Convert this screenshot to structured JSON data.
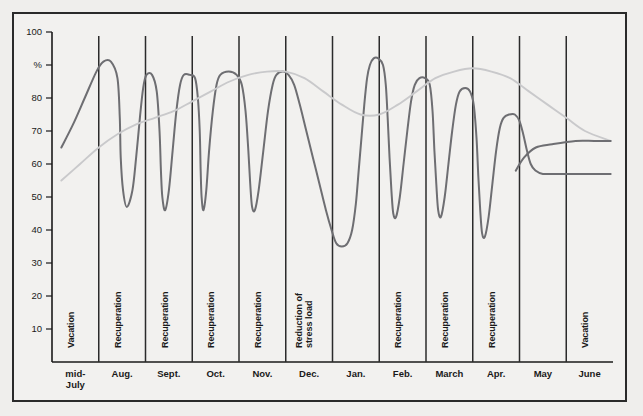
{
  "chart_data": {
    "type": "line",
    "title": "",
    "xlabel": "",
    "ylabel": "%",
    "ylim": [
      0,
      100
    ],
    "grid": false,
    "legend": "none",
    "y_ticks": [
      "100",
      "%",
      "80",
      "70",
      "60",
      "50",
      "40",
      "30",
      "20",
      "10"
    ],
    "y_tick_values": [
      100,
      90,
      80,
      70,
      60,
      50,
      40,
      30,
      20,
      10
    ],
    "categories": [
      "mid-July",
      "Aug.",
      "Sept.",
      "Oct.",
      "Nov.",
      "Dec.",
      "Jan.",
      "Feb.",
      "March",
      "Apr.",
      "May",
      "June"
    ],
    "period_labels": [
      {
        "label": "Vacation",
        "month": "mid-July"
      },
      {
        "label": "Recuperation",
        "month": "Aug."
      },
      {
        "label": "Recuperation",
        "month": "Sept."
      },
      {
        "label": "Recuperation",
        "month": "Oct."
      },
      {
        "label": "Recuperation",
        "month": "Nov."
      },
      {
        "label": "Reduction of stress load",
        "month": "Dec."
      },
      {
        "label": "Recuperation",
        "month": "Feb."
      },
      {
        "label": "Recuperation",
        "month": "March"
      },
      {
        "label": "Recuperation",
        "month": "Apr."
      },
      {
        "label": "Vacation",
        "month": "June"
      }
    ],
    "series": [
      {
        "name": "performance-oscillating",
        "color": "#6e6e72",
        "points": [
          [
            0.2,
            65
          ],
          [
            0.45,
            72
          ],
          [
            0.7,
            80
          ],
          [
            0.95,
            88
          ],
          [
            1.1,
            91
          ],
          [
            1.26,
            91
          ],
          [
            1.4,
            86
          ],
          [
            1.45,
            74
          ],
          [
            1.47,
            62
          ],
          [
            1.52,
            52
          ],
          [
            1.6,
            47
          ],
          [
            1.72,
            52
          ],
          [
            1.8,
            62
          ],
          [
            1.88,
            74
          ],
          [
            1.95,
            83
          ],
          [
            2.02,
            87
          ],
          [
            2.14,
            87
          ],
          [
            2.24,
            82
          ],
          [
            2.3,
            70
          ],
          [
            2.33,
            58
          ],
          [
            2.36,
            50
          ],
          [
            2.42,
            46
          ],
          [
            2.5,
            52
          ],
          [
            2.58,
            64
          ],
          [
            2.66,
            76
          ],
          [
            2.74,
            84
          ],
          [
            2.82,
            87
          ],
          [
            2.95,
            87
          ],
          [
            3.06,
            86
          ],
          [
            3.12,
            80
          ],
          [
            3.16,
            70
          ],
          [
            3.18,
            58
          ],
          [
            3.2,
            50
          ],
          [
            3.24,
            46
          ],
          [
            3.3,
            52
          ],
          [
            3.36,
            64
          ],
          [
            3.44,
            76
          ],
          [
            3.52,
            84
          ],
          [
            3.6,
            87
          ],
          [
            3.78,
            88
          ],
          [
            3.95,
            87
          ],
          [
            4.06,
            84
          ],
          [
            4.14,
            76
          ],
          [
            4.2,
            64
          ],
          [
            4.24,
            54
          ],
          [
            4.28,
            47
          ],
          [
            4.34,
            46
          ],
          [
            4.42,
            52
          ],
          [
            4.52,
            64
          ],
          [
            4.62,
            76
          ],
          [
            4.72,
            84
          ],
          [
            4.8,
            87
          ],
          [
            4.94,
            88
          ],
          [
            5.06,
            87
          ],
          [
            5.18,
            84
          ],
          [
            5.3,
            78
          ],
          [
            5.44,
            70
          ],
          [
            5.58,
            62
          ],
          [
            5.72,
            54
          ],
          [
            5.86,
            46
          ],
          [
            5.98,
            40
          ],
          [
            6.08,
            36
          ],
          [
            6.2,
            35
          ],
          [
            6.32,
            36
          ],
          [
            6.42,
            40
          ],
          [
            6.5,
            48
          ],
          [
            6.56,
            58
          ],
          [
            6.62,
            68
          ],
          [
            6.68,
            78
          ],
          [
            6.74,
            86
          ],
          [
            6.8,
            90
          ],
          [
            6.88,
            92
          ],
          [
            6.98,
            92
          ],
          [
            7.08,
            90
          ],
          [
            7.14,
            84
          ],
          [
            7.18,
            74
          ],
          [
            7.22,
            62
          ],
          [
            7.26,
            52
          ],
          [
            7.3,
            45
          ],
          [
            7.36,
            44
          ],
          [
            7.44,
            50
          ],
          [
            7.52,
            60
          ],
          [
            7.6,
            70
          ],
          [
            7.68,
            79
          ],
          [
            7.76,
            84
          ],
          [
            7.86,
            86
          ],
          [
            7.98,
            86
          ],
          [
            8.08,
            84
          ],
          [
            8.14,
            76
          ],
          [
            8.18,
            64
          ],
          [
            8.22,
            54
          ],
          [
            8.26,
            46
          ],
          [
            8.32,
            44
          ],
          [
            8.4,
            50
          ],
          [
            8.48,
            60
          ],
          [
            8.56,
            70
          ],
          [
            8.64,
            78
          ],
          [
            8.72,
            82
          ],
          [
            8.84,
            83
          ],
          [
            8.94,
            82
          ],
          [
            9.02,
            78
          ],
          [
            9.08,
            68
          ],
          [
            9.12,
            56
          ],
          [
            9.16,
            46
          ],
          [
            9.2,
            39
          ],
          [
            9.26,
            38
          ],
          [
            9.34,
            44
          ],
          [
            9.42,
            54
          ],
          [
            9.5,
            64
          ],
          [
            9.58,
            71
          ],
          [
            9.66,
            74
          ],
          [
            9.78,
            75
          ],
          [
            9.9,
            75
          ],
          [
            10.0,
            73
          ],
          [
            10.08,
            69
          ],
          [
            10.16,
            64
          ],
          [
            10.24,
            60
          ],
          [
            10.34,
            58
          ],
          [
            10.5,
            57
          ],
          [
            10.8,
            57
          ],
          [
            11.2,
            57
          ],
          [
            11.6,
            57
          ],
          [
            11.95,
            57
          ]
        ]
      },
      {
        "name": "recovery-trend",
        "color": "#c9c9cb",
        "points": [
          [
            0.2,
            55
          ],
          [
            0.6,
            60
          ],
          [
            1.0,
            65
          ],
          [
            1.4,
            69
          ],
          [
            1.8,
            72
          ],
          [
            2.2,
            74
          ],
          [
            2.6,
            76
          ],
          [
            3.0,
            79
          ],
          [
            3.4,
            82
          ],
          [
            3.8,
            85
          ],
          [
            4.2,
            87
          ],
          [
            4.6,
            88
          ],
          [
            5.0,
            88
          ],
          [
            5.4,
            86
          ],
          [
            5.8,
            82
          ],
          [
            6.2,
            78
          ],
          [
            6.6,
            75
          ],
          [
            7.0,
            75
          ],
          [
            7.4,
            78
          ],
          [
            7.8,
            82
          ],
          [
            8.2,
            86
          ],
          [
            8.6,
            88
          ],
          [
            9.0,
            89
          ],
          [
            9.4,
            88
          ],
          [
            9.8,
            86
          ],
          [
            10.2,
            82
          ],
          [
            10.6,
            78
          ],
          [
            11.0,
            74
          ],
          [
            11.4,
            70
          ],
          [
            11.95,
            67
          ]
        ]
      },
      {
        "name": "upper-plateau",
        "color": "#6e6e72",
        "points": [
          [
            9.92,
            58
          ],
          [
            10.1,
            62
          ],
          [
            10.35,
            65
          ],
          [
            10.7,
            66
          ],
          [
            11.2,
            67
          ],
          [
            11.6,
            67
          ],
          [
            11.95,
            67
          ]
        ]
      }
    ]
  }
}
